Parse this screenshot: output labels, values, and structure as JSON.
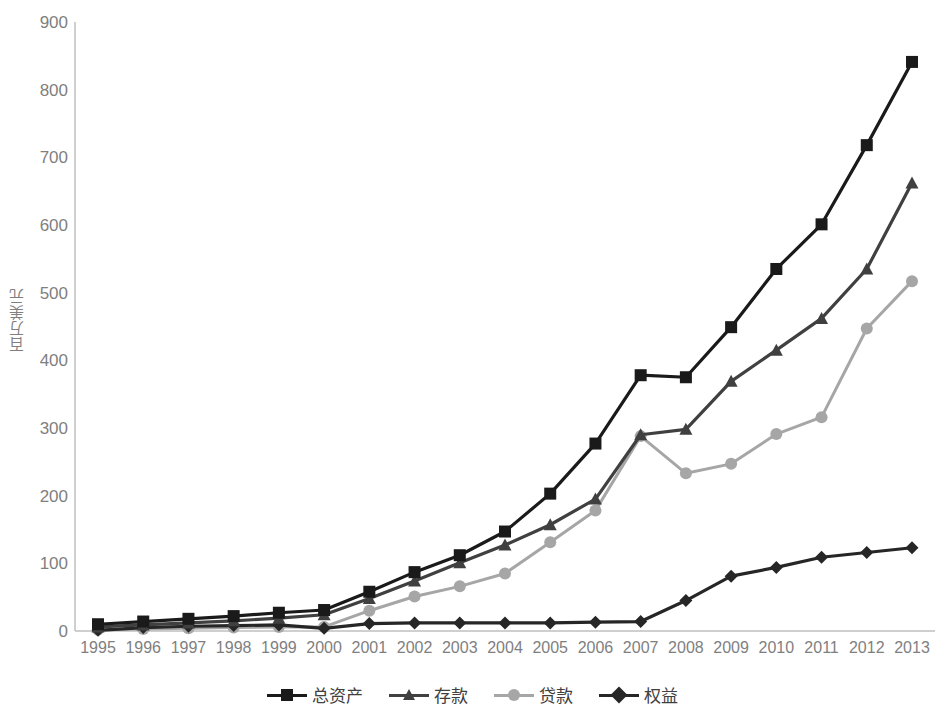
{
  "chart_data": {
    "type": "line",
    "title": "",
    "subtitle": "",
    "xlabel": "",
    "ylabel": "百万美元",
    "x": [
      1995,
      1996,
      1997,
      1998,
      1999,
      2000,
      2001,
      2002,
      2003,
      2004,
      2005,
      2006,
      2007,
      2008,
      2009,
      2010,
      2011,
      2012,
      2013
    ],
    "categories": [
      "1995",
      "1996",
      "1997",
      "1998",
      "1999",
      "2000",
      "2001",
      "2002",
      "2003",
      "2004",
      "2005",
      "2006",
      "2007",
      "2008",
      "2009",
      "2010",
      "2011",
      "2012",
      "2013"
    ],
    "series": [
      {
        "name": "总资产",
        "color": "#1a1a1a",
        "marker": "square",
        "values": [
          10,
          14,
          18,
          22,
          27,
          31,
          58,
          87,
          112,
          147,
          203,
          277,
          378,
          375,
          449,
          535,
          601,
          718,
          841
        ]
      },
      {
        "name": "存款",
        "color": "#404040",
        "marker": "triangle",
        "values": [
          6,
          9,
          12,
          15,
          19,
          24,
          48,
          74,
          101,
          127,
          157,
          195,
          290,
          298,
          369,
          415,
          462,
          535,
          662
        ]
      },
      {
        "name": "贷款",
        "color": "#a6a6a6",
        "marker": "circle",
        "values": [
          2,
          3,
          4,
          5,
          6,
          6,
          30,
          51,
          66,
          85,
          131,
          178,
          288,
          233,
          247,
          291,
          316,
          447,
          517
        ]
      },
      {
        "name": "权益",
        "color": "#262626",
        "marker": "diamond",
        "values": [
          1,
          5,
          7,
          8,
          9,
          4,
          11,
          12,
          12,
          12,
          12,
          13,
          14,
          45,
          81,
          94,
          109,
          116,
          123
        ]
      }
    ],
    "ylim": [
      0,
      900
    ],
    "y_ticks": [
      0,
      100,
      200,
      300,
      400,
      500,
      600,
      700,
      800,
      900
    ],
    "y_tick_labels": [
      "0",
      "100",
      "200",
      "300",
      "400",
      "500",
      "600",
      "700",
      "800",
      "900"
    ],
    "grid": false,
    "legend_position": "bottom",
    "axis_color": "#bfbfbf",
    "tick_label_color": "#7f7f7f"
  },
  "legend": {
    "items": [
      {
        "label": "总资产"
      },
      {
        "label": "存款"
      },
      {
        "label": "贷款"
      },
      {
        "label": "权益"
      }
    ]
  }
}
